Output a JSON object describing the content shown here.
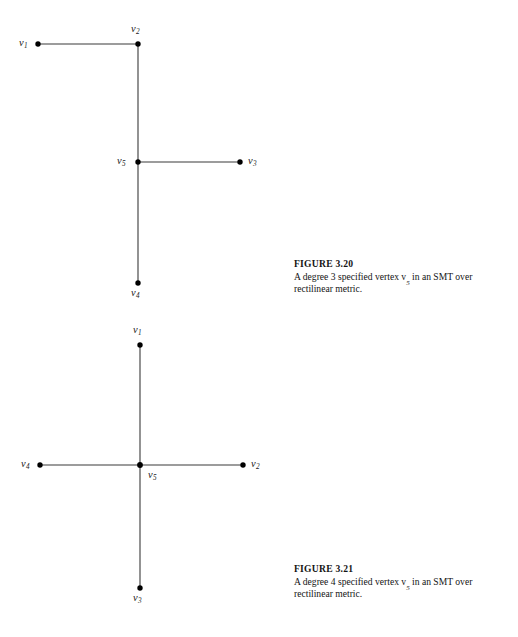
{
  "page": {
    "background": "#ffffff",
    "width": 518,
    "height": 637
  },
  "figures": [
    {
      "id": "figure-3-20",
      "caption_title": "FIGURE 3.20",
      "caption_line1": "A degree 3 specified vertex v",
      "caption_sub": "5",
      "caption_line1_tail": " in an SMT over",
      "caption_line2": "rectilinear metric.",
      "caption_full": "A degree 3 specified vertex v5 in an SMT over rectilinear metric.",
      "line_color": "#3a3a3a",
      "node_color": "#000000",
      "nodes": [
        {
          "name": "v1",
          "letter": "v",
          "sub": "1",
          "x": 38,
          "y": 44,
          "label_x": 19,
          "label_y": 38
        },
        {
          "name": "v2",
          "letter": "v",
          "sub": "2",
          "x": 138,
          "y": 44,
          "label_x": 131,
          "label_y": 24
        },
        {
          "name": "v5",
          "letter": "v",
          "sub": "5",
          "x": 138,
          "y": 162,
          "label_x": 117,
          "label_y": 156
        },
        {
          "name": "v3",
          "letter": "v",
          "sub": "3",
          "x": 240,
          "y": 162,
          "label_x": 248,
          "label_y": 162
        },
        {
          "name": "v4",
          "letter": "v",
          "sub": "4",
          "x": 138,
          "y": 283,
          "label_x": 131,
          "label_y": 288
        }
      ],
      "edges": [
        {
          "from": "v1",
          "to": "v2"
        },
        {
          "from": "v2",
          "to": "v5"
        },
        {
          "from": "v5",
          "to": "v3"
        },
        {
          "from": "v5",
          "to": "v4"
        }
      ],
      "caption_top": 258
    },
    {
      "id": "figure-3-21",
      "caption_title": "FIGURE 3.21",
      "caption_line1": "A degree 4 specified vertex v",
      "caption_sub": "5",
      "caption_line1_tail": " in an SMT over",
      "caption_line2": "rectilinear metric.",
      "caption_full": "A degree 4 specified vertex v5 in an SMT over rectilinear metric.",
      "line_color": "#3a3a3a",
      "node_color": "#000000",
      "nodes": [
        {
          "name": "v1",
          "letter": "v",
          "sub": "1",
          "x": 140,
          "y": 345,
          "label_x": 133,
          "label_y": 325
        },
        {
          "name": "v4",
          "letter": "v",
          "sub": "4",
          "x": 40,
          "y": 465,
          "label_x": 21,
          "label_y": 459
        },
        {
          "name": "v5",
          "letter": "v",
          "sub": "5",
          "x": 140,
          "y": 465,
          "label_x": 148,
          "label_y": 470
        },
        {
          "name": "v2",
          "letter": "v",
          "sub": "2",
          "x": 243,
          "y": 465,
          "label_x": 251,
          "label_y": 459
        },
        {
          "name": "v3",
          "letter": "v",
          "sub": "3",
          "x": 140,
          "y": 588,
          "label_x": 133,
          "label_y": 593
        }
      ],
      "edges": [
        {
          "from": "v1",
          "to": "v5"
        },
        {
          "from": "v5",
          "to": "v3"
        },
        {
          "from": "v4",
          "to": "v5"
        },
        {
          "from": "v5",
          "to": "v2"
        }
      ],
      "caption_top": 563
    }
  ]
}
